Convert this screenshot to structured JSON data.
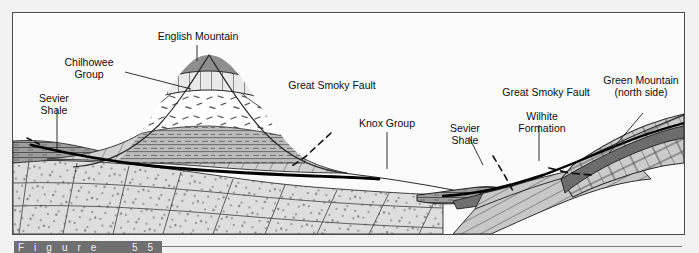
{
  "figure": {
    "caption_fragment": "Figure  55-10",
    "background_color": "#f2f2f2",
    "frame_color": "#4b4b4b"
  },
  "labels": {
    "english_mountain": "English Mountain",
    "chilhowee_group": "Chilhowee\nGroup",
    "sevier_shale_left": "Sevier\nShale",
    "great_smoky_fault_left": "Great Smoky Fault",
    "knox_group": "Knox Group",
    "sevier_shale_right": "Sevier\nShale",
    "great_smoky_fault_right": "Great Smoky Fault",
    "wilhite_formation": "Wilhite\nFormation",
    "green_mountain": "Green Mountain\n(north side)"
  },
  "units": [
    {
      "id": "summit-cap",
      "name": "English Mountain summit cap",
      "pattern": "solid-dark-gray",
      "color": "#8f8f8f"
    },
    {
      "id": "chilhowee-quartzite",
      "name": "Chilhowee Group quartzite band",
      "pattern": "brick-grid",
      "color": "#e8e8e8"
    },
    {
      "id": "chilhowee-conglomerate",
      "name": "Chilhowee conglomerate",
      "pattern": "dashes",
      "color": "#ffffff"
    },
    {
      "id": "chilhowee-shale",
      "name": "Chilhowee shale bands",
      "pattern": "horizontal-dash",
      "color": "#b9b9b9"
    },
    {
      "id": "great-smoky-group",
      "name": "Great Smoky Group",
      "pattern": "diagonal-hatch",
      "color": "#cfcfcf"
    },
    {
      "id": "knox-group",
      "name": "Knox Group",
      "pattern": "stipple-blocks",
      "color": "#dcdcdc"
    },
    {
      "id": "sevier-shale",
      "name": "Sevier Shale",
      "pattern": "thin-horizontal",
      "color": "#9a9a9a"
    },
    {
      "id": "wilhite-formation",
      "name": "Wilhite Formation",
      "pattern": "steep-hatch",
      "color": "#c6c6c6"
    },
    {
      "id": "green-mountain",
      "name": "Green Mountain carbonate",
      "pattern": "brick",
      "color": "#cacaca"
    }
  ],
  "faults": [
    {
      "id": "great-smoky-fault-main",
      "name": "Great Smoky Fault (solid trace)",
      "style": "solid-heavy",
      "color": "#000000"
    },
    {
      "id": "great-smoky-fault-dashed",
      "name": "Great Smoky Fault (projected)",
      "style": "dashed",
      "color": "#111111"
    }
  ]
}
